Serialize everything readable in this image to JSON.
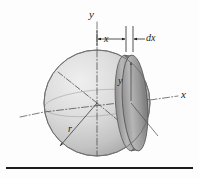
{
  "figure": {
    "caption": "",
    "background_color": "#fdfdfd",
    "ink_color": "#1a1a1a",
    "baseline_rule_color": "#1c1c1c"
  },
  "axes": {
    "y_axis_label": "y",
    "x_axis_label": "x",
    "axis_line_style": "dash-dot",
    "axis_color": "#555555"
  },
  "dimensions": {
    "x_offset_label": "x",
    "dx_thickness_label": "dx",
    "arrow_color": "#1a1a1a"
  },
  "sphere": {
    "radius_label": "r",
    "fill_light": "#e8e8e8",
    "fill_mid": "#c9c9c9",
    "fill_dark": "#9c9c9c",
    "outline_color": "#6d6d6d"
  },
  "disc_slice": {
    "radius_label": "y",
    "fill_light": "#bdbdbd",
    "fill_dark": "#7d7d7d",
    "edge_color": "#5a5a5a"
  }
}
